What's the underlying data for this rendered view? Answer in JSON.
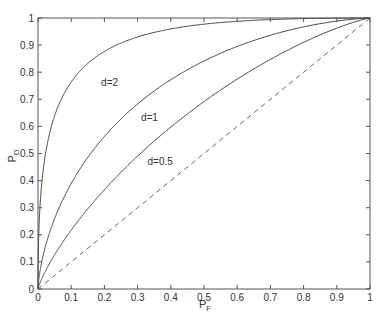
{
  "chart_data": {
    "type": "line",
    "title": "",
    "xlabel": "P_F",
    "ylabel": "P_D",
    "xlim": [
      0,
      1
    ],
    "ylim": [
      0,
      1
    ],
    "grid": false,
    "legend": "none (inline curve labels)",
    "xticks": [
      "0",
      "0.1",
      "0.2",
      "0.3",
      "0.4",
      "0.5",
      "0.6",
      "0.7",
      "0.8",
      "0.9",
      "1"
    ],
    "yticks": [
      "0",
      "0.1",
      "0.2",
      "0.3",
      "0.4",
      "0.5",
      "0.6",
      "0.7",
      "0.8",
      "0.9",
      "1"
    ],
    "model": "P_D = Q(Q^-1(P_F) - d)",
    "series": [
      {
        "name": "d=2",
        "style": "solid",
        "x": [
          0,
          0.01,
          0.05,
          0.1,
          0.2,
          0.3,
          0.4,
          0.5,
          0.6,
          0.7,
          0.8,
          0.9,
          1
        ],
        "y": [
          0,
          0.37,
          0.64,
          0.76,
          0.88,
          0.93,
          0.96,
          0.98,
          0.99,
          0.99,
          1.0,
          1.0,
          1
        ]
      },
      {
        "name": "d=1",
        "style": "solid",
        "x": [
          0,
          0.01,
          0.05,
          0.1,
          0.2,
          0.3,
          0.4,
          0.5,
          0.6,
          0.7,
          0.8,
          0.9,
          1
        ],
        "y": [
          0,
          0.09,
          0.26,
          0.39,
          0.56,
          0.69,
          0.78,
          0.84,
          0.9,
          0.94,
          0.97,
          0.99,
          1
        ]
      },
      {
        "name": "d=0.5",
        "style": "solid",
        "x": [
          0,
          0.01,
          0.05,
          0.1,
          0.2,
          0.3,
          0.4,
          0.5,
          0.6,
          0.7,
          0.8,
          0.9,
          1
        ],
        "y": [
          0,
          0.03,
          0.13,
          0.22,
          0.37,
          0.49,
          0.6,
          0.69,
          0.77,
          0.84,
          0.9,
          0.96,
          1
        ]
      },
      {
        "name": "chance",
        "style": "dashed",
        "x": [
          0,
          1
        ],
        "y": [
          0,
          1
        ]
      }
    ],
    "annotations": [
      {
        "text": "d=2",
        "x": 0.19,
        "y": 0.76
      },
      {
        "text": "d=1",
        "x": 0.31,
        "y": 0.63
      },
      {
        "text": "d=0.5",
        "x": 0.33,
        "y": 0.47
      }
    ]
  }
}
